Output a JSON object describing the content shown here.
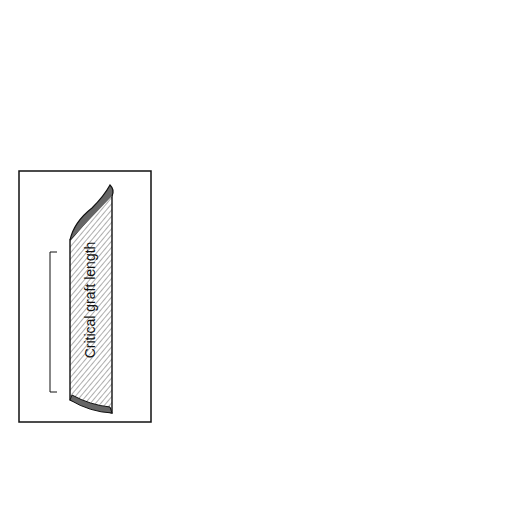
{
  "figure": {
    "type": "surgical-illustration",
    "colors": {
      "line": "#111111",
      "background": "#ffffff",
      "hatch": "#333333"
    }
  },
  "inset": {
    "label": "Critical graft length",
    "bracket_span": "graft body between beveled ends"
  }
}
